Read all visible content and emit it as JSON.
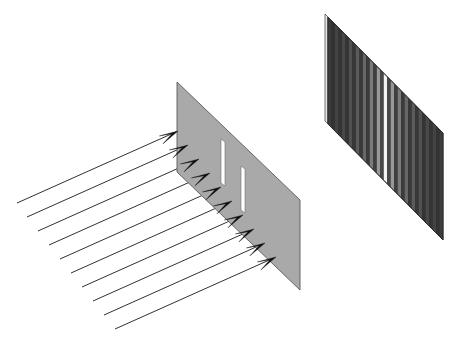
{
  "figure": {
    "width": 463,
    "height": 346,
    "background_color": "#ffffff",
    "caption": ""
  },
  "colors": {
    "background": "#ffffff",
    "barrier_fill": "#a9a9a9",
    "barrier_stroke": "#5a5a5a",
    "slit_fill": "#ffffff",
    "ray_stroke": "#1a1a1a",
    "arrowhead_fill": "#0d0d0d",
    "screen_dark": "#2b2b2b",
    "screen_bright": "#f2f2f2",
    "screen_edge": "#e8e8e8"
  },
  "incident_beam": {
    "name": "incident plane wave",
    "description": "Ten parallel arrows travelling up and to the right toward the barrier",
    "arrow_count": 10,
    "direction_label": "up-right",
    "rays": [
      {
        "index": 1,
        "x1": 17,
        "y1": 203,
        "x2": 178,
        "y2": 131
      },
      {
        "index": 2,
        "x1": 27,
        "y1": 217,
        "x2": 188,
        "y2": 145
      },
      {
        "index": 3,
        "x1": 38,
        "y1": 231,
        "x2": 199,
        "y2": 159
      },
      {
        "index": 4,
        "x1": 49,
        "y1": 245,
        "x2": 210,
        "y2": 173
      },
      {
        "index": 5,
        "x1": 60,
        "y1": 259,
        "x2": 221,
        "y2": 187
      },
      {
        "index": 6,
        "x1": 71,
        "y1": 273,
        "x2": 232,
        "y2": 201
      },
      {
        "index": 7,
        "x1": 82,
        "y1": 287,
        "x2": 243,
        "y2": 215
      },
      {
        "index": 8,
        "x1": 93,
        "y1": 301,
        "x2": 254,
        "y2": 229
      },
      {
        "index": 9,
        "x1": 104,
        "y1": 315,
        "x2": 265,
        "y2": 243
      },
      {
        "index": 10,
        "x1": 115,
        "y1": 329,
        "x2": 276,
        "y2": 257
      }
    ]
  },
  "barrier": {
    "name": "barrier with two slits",
    "fill": "#a9a9a9",
    "outline_points": "177,82 300,200 300,290 177,172",
    "front_edge": {
      "x1": 177,
      "y1": 82,
      "x2": 300,
      "y2": 200
    },
    "slits": [
      {
        "label": "slit 1",
        "points": "221,139 225,142 225,186 221,183"
      },
      {
        "label": "slit 2",
        "points": "241,166 245,169 245,213 241,210"
      }
    ]
  },
  "observation_screen": {
    "name": "observation screen with interference fringes",
    "outline_points": "328,17 443,133 443,240 328,124",
    "edge_strip_points": "325,14 328,17 328,124 325,121",
    "fringe_count": 33,
    "pattern_type": "double-slit interference fringes",
    "center_fraction": 0.5,
    "description": "Vertical fringes: bright central maximum flanked by fringes of decreasing brightness toward both edges",
    "fringes": [
      {
        "i": 0,
        "brightness": 0.09
      },
      {
        "i": 1,
        "brightness": 0.04
      },
      {
        "i": 2,
        "brightness": 0.12
      },
      {
        "i": 3,
        "brightness": 0.05
      },
      {
        "i": 4,
        "brightness": 0.15
      },
      {
        "i": 5,
        "brightness": 0.05
      },
      {
        "i": 6,
        "brightness": 0.19
      },
      {
        "i": 7,
        "brightness": 0.06
      },
      {
        "i": 8,
        "brightness": 0.24
      },
      {
        "i": 9,
        "brightness": 0.07
      },
      {
        "i": 10,
        "brightness": 0.3
      },
      {
        "i": 11,
        "brightness": 0.08
      },
      {
        "i": 12,
        "brightness": 0.4
      },
      {
        "i": 13,
        "brightness": 0.1
      },
      {
        "i": 14,
        "brightness": 0.55
      },
      {
        "i": 15,
        "brightness": 0.14
      },
      {
        "i": 16,
        "brightness": 1.0
      },
      {
        "i": 17,
        "brightness": 0.14
      },
      {
        "i": 18,
        "brightness": 0.55
      },
      {
        "i": 19,
        "brightness": 0.1
      },
      {
        "i": 20,
        "brightness": 0.4
      },
      {
        "i": 21,
        "brightness": 0.08
      },
      {
        "i": 22,
        "brightness": 0.3
      },
      {
        "i": 23,
        "brightness": 0.07
      },
      {
        "i": 24,
        "brightness": 0.24
      },
      {
        "i": 25,
        "brightness": 0.06
      },
      {
        "i": 26,
        "brightness": 0.19
      },
      {
        "i": 27,
        "brightness": 0.05
      },
      {
        "i": 28,
        "brightness": 0.15
      },
      {
        "i": 29,
        "brightness": 0.05
      },
      {
        "i": 30,
        "brightness": 0.12
      },
      {
        "i": 31,
        "brightness": 0.04
      },
      {
        "i": 32,
        "brightness": 0.09
      }
    ]
  }
}
